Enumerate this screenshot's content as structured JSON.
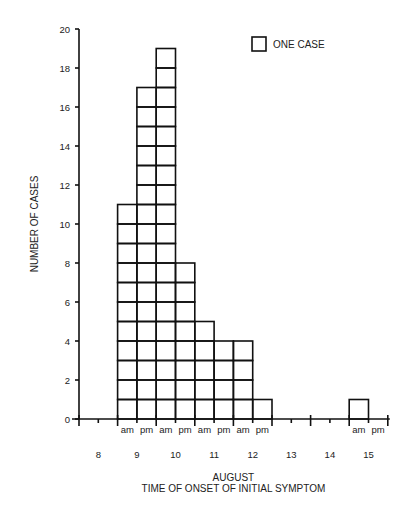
{
  "chart_data": {
    "type": "bar",
    "title": "",
    "xlabel": "AUGUST\nTIME OF ONSET OF INITIAL SYMPTOM",
    "ylabel": "NUMBER OF CASES",
    "ylim": [
      0,
      20
    ],
    "yticks": [
      0,
      2,
      4,
      6,
      8,
      10,
      12,
      14,
      16,
      18,
      20
    ],
    "legend": "ONE CASE",
    "days": [
      "8",
      "9",
      "10",
      "11",
      "12",
      "13",
      "14",
      "15"
    ],
    "categories": [
      "8 am",
      "8 pm",
      "9 am",
      "9 pm",
      "10 am",
      "10 pm",
      "11 am",
      "11 pm",
      "12 am",
      "12 pm",
      "13 am",
      "13 pm",
      "14 am",
      "14 pm",
      "15 am",
      "15 pm"
    ],
    "values": [
      0,
      0,
      11,
      17,
      19,
      8,
      5,
      4,
      4,
      1,
      0,
      0,
      0,
      0,
      1,
      0
    ],
    "grid": false
  },
  "labels": {
    "ylabel": "NUMBER OF CASES",
    "legend": "ONE CASE",
    "xlabel_line1": "AUGUST",
    "xlabel_line2": "TIME OF ONSET OF INITIAL SYMPTOM",
    "am": "am",
    "pm": "pm"
  }
}
